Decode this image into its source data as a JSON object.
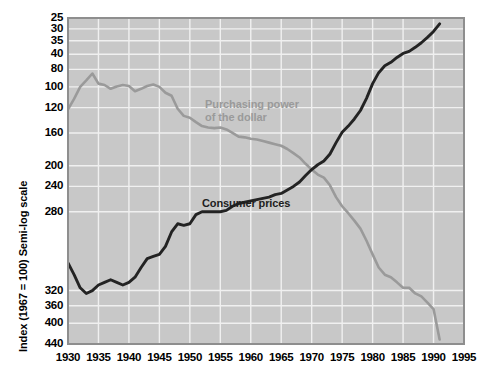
{
  "chart_data": {
    "type": "line",
    "title": "",
    "xlabel": "",
    "ylabel": "Index (1967 = 100) Semi-log scale",
    "scale": "semi-log",
    "grid": true,
    "legend_position": "inline-annotations",
    "xlim": [
      1930,
      1995
    ],
    "ylim": [
      25,
      440
    ],
    "xticks": [
      1930,
      1935,
      1940,
      1945,
      1950,
      1955,
      1960,
      1965,
      1970,
      1975,
      1980,
      1985,
      1990,
      1995
    ],
    "yticks": [
      25,
      30,
      35,
      40,
      80,
      100,
      120,
      160,
      200,
      240,
      280,
      320,
      360,
      400,
      440
    ],
    "annotations": [
      {
        "text": "Purchasing power\nof the dollar",
        "color": "#9a9a9a",
        "x": 1952.5,
        "y": 205
      },
      {
        "text": "Consumer prices",
        "color": "#1e1e1e",
        "x": 1952.0,
        "y": 86
      }
    ],
    "series": [
      {
        "name": "Purchasing power of the dollar",
        "color": "#9a9a9a",
        "x": [
          1930,
          1931,
          1932,
          1933,
          1934,
          1935,
          1936,
          1937,
          1938,
          1939,
          1940,
          1941,
          1942,
          1943,
          1944,
          1945,
          1946,
          1947,
          1948,
          1949,
          1950,
          1951,
          1952,
          1953,
          1954,
          1955,
          1956,
          1957,
          1958,
          1959,
          1960,
          1961,
          1962,
          1963,
          1964,
          1965,
          1966,
          1967,
          1968,
          1969,
          1970,
          1971,
          1972,
          1973,
          1974,
          1975,
          1976,
          1977,
          1978,
          1979,
          1980,
          1981,
          1982,
          1983,
          1984,
          1985,
          1986,
          1987,
          1988,
          1989,
          1990,
          1991
        ],
        "y": [
          197,
          216,
          240,
          254,
          270,
          247,
          244,
          236,
          241,
          244,
          242,
          231,
          236,
          242,
          245,
          240,
          228,
          222,
          198,
          186,
          183,
          176,
          170,
          168,
          167,
          168,
          165,
          160,
          155,
          154,
          152,
          151,
          149,
          147,
          145,
          143,
          139,
          134,
          129,
          122,
          116,
          111,
          108,
          101,
          91,
          84,
          79,
          74,
          69,
          62,
          55,
          49,
          46,
          45,
          43,
          41,
          41,
          39,
          38,
          36,
          34,
          26
        ]
      },
      {
        "name": "Consumer prices",
        "color": "#232323",
        "x": [
          1930,
          1931,
          1932,
          1933,
          1934,
          1935,
          1936,
          1937,
          1938,
          1939,
          1940,
          1941,
          1942,
          1943,
          1944,
          1945,
          1946,
          1947,
          1948,
          1949,
          1950,
          1951,
          1952,
          1953,
          1954,
          1955,
          1956,
          1957,
          1958,
          1959,
          1960,
          1961,
          1962,
          1963,
          1964,
          1965,
          1966,
          1967,
          1968,
          1969,
          1970,
          1971,
          1972,
          1973,
          1974,
          1975,
          1976,
          1977,
          1978,
          1979,
          1980,
          1981,
          1982,
          1983,
          1984,
          1985,
          1986,
          1987,
          1988,
          1989,
          1990,
          1991
        ],
        "y": [
          51,
          46,
          41,
          39,
          40,
          42,
          43,
          44,
          43,
          42,
          43,
          45,
          49,
          53,
          54,
          55,
          59,
          67,
          72,
          71,
          72,
          78,
          80,
          80,
          80,
          80,
          81,
          84,
          86,
          87,
          88,
          89,
          90,
          91,
          93,
          94,
          97,
          100,
          104,
          110,
          116,
          121,
          125,
          133,
          147,
          161,
          170,
          181,
          195,
          217,
          247,
          272,
          289,
          298,
          311,
          322,
          328,
          340,
          354,
          371,
          391,
          418
        ]
      }
    ]
  },
  "axis": {
    "y_title": "Index (1967 = 100) Semi-log scale",
    "y_tick_labels": [
      "440",
      "400",
      "360",
      "320",
      "280",
      "240",
      "200",
      "160",
      "120",
      "100",
      "80",
      "40",
      "35",
      "30",
      "25"
    ],
    "x_tick_labels": [
      "1930",
      "1935",
      "1940",
      "1945",
      "1950",
      "1955",
      "1960",
      "1965",
      "1970",
      "1975",
      "1980",
      "1985",
      "1990",
      "1995"
    ]
  },
  "style": {
    "plot_background": "#c8c8c8",
    "gridline_color": "#f0f0f0",
    "page_background": "#ffffff",
    "border_color": "#8e8e8e"
  }
}
